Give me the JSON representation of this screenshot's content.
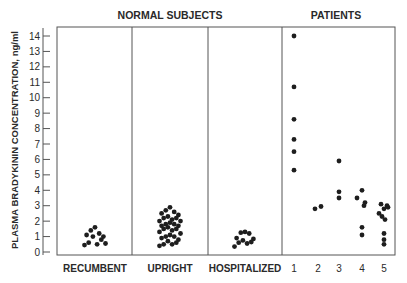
{
  "chart_data": {
    "type": "scatter",
    "title": "",
    "group_headers": [
      {
        "label": "NORMAL SUBJECTS",
        "spans": [
          "RECUMBENT",
          "UPRIGHT",
          "HOSPITALIZED"
        ]
      },
      {
        "label": "PATIENTS",
        "spans": [
          "1",
          "2",
          "3",
          "4",
          "5"
        ]
      }
    ],
    "ylabel": "PLASMA BRADYKININ CONCENTRATION, ng/ml",
    "xlabel": "",
    "ylim": [
      0,
      14
    ],
    "yticks": [
      0,
      1,
      2,
      3,
      4,
      5,
      6,
      7,
      8,
      9,
      10,
      11,
      12,
      13,
      14
    ],
    "grid": false,
    "panels": [
      {
        "name": "RECUMBENT",
        "category": "RECUMBENT",
        "values": [
          1.6,
          1.4,
          1.2,
          1.1,
          1.0,
          1.0,
          0.8,
          0.6,
          0.5,
          0.45,
          0.55
        ]
      },
      {
        "name": "UPRIGHT",
        "category": "UPRIGHT",
        "values": [
          2.9,
          2.7,
          2.6,
          2.5,
          2.4,
          2.3,
          2.2,
          2.2,
          2.1,
          2.0,
          2.0,
          1.9,
          1.8,
          1.8,
          1.7,
          1.7,
          1.6,
          1.5,
          1.5,
          1.4,
          1.3,
          1.2,
          1.1,
          1.0,
          1.0,
          0.9,
          0.8,
          0.7,
          0.6,
          0.5,
          0.5,
          0.4
        ]
      },
      {
        "name": "HOSPITALIZED",
        "category": "HOSPITALIZED",
        "values": [
          1.3,
          1.25,
          1.2,
          0.9,
          0.85,
          0.75,
          0.65,
          0.6,
          0.55,
          0.35
        ]
      },
      {
        "name": "PATIENTS",
        "categories": [
          "1",
          "2",
          "3",
          "4",
          "5"
        ],
        "series": [
          {
            "name": "1",
            "values": [
              14.0,
              10.7,
              8.6,
              7.3,
              6.5,
              5.3
            ]
          },
          {
            "name": "2",
            "values": [
              2.8,
              2.95
            ]
          },
          {
            "name": "3",
            "values": [
              5.9,
              3.9,
              3.5
            ]
          },
          {
            "name": "4",
            "values": [
              4.0,
              3.5,
              3.2,
              3.0,
              1.6,
              1.1
            ]
          },
          {
            "name": "5",
            "values": [
              3.1,
              3.0,
              2.8,
              2.9,
              2.5,
              2.3,
              2.1,
              1.2,
              0.8,
              0.5
            ]
          }
        ]
      }
    ],
    "category_labels": [
      "RECUMBENT",
      "UPRIGHT",
      "HOSPITALIZED",
      "1",
      "2",
      "3",
      "4",
      "5"
    ]
  }
}
